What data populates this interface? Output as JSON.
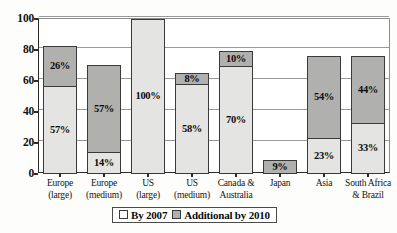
{
  "chart_data": {
    "type": "bar",
    "subtype": "stacked-bar",
    "title": "",
    "xlabel": "",
    "ylabel": "",
    "ylim": [
      0,
      100
    ],
    "yticks": [
      0,
      20,
      40,
      60,
      80,
      100
    ],
    "grid": true,
    "legend_position": "bottom-center",
    "categories": [
      "Europe (large)",
      "Europe (medium)",
      "US (large)",
      "US (medium)",
      "Canada & Australia",
      "Japan",
      "Asia",
      "South Africa & Brazil"
    ],
    "category_lines": [
      [
        "Europe",
        "(large)"
      ],
      [
        "Europe",
        "(medium)"
      ],
      [
        "US",
        "(large)"
      ],
      [
        "US",
        "(medium)"
      ],
      [
        "Canada &",
        "Australia"
      ],
      [
        "Japan",
        ""
      ],
      [
        "Asia",
        ""
      ],
      [
        "South Africa",
        "& Brazil"
      ]
    ],
    "series": [
      {
        "name": "By 2007",
        "color": "#e4e4e2",
        "values": [
          57,
          14,
          100,
          58,
          70,
          0,
          23,
          33
        ]
      },
      {
        "name": "Additional by 2010",
        "color": "#b0b0ae",
        "values": [
          26,
          57,
          0,
          8,
          10,
          9,
          54,
          44
        ]
      }
    ],
    "totals": [
      83,
      71,
      100,
      66,
      80,
      9,
      77,
      77
    ],
    "data_labels": {
      "by2007": [
        "57%",
        "14%",
        "100%",
        "58%",
        "70%",
        "",
        "23%",
        "33%"
      ],
      "additional": [
        "26%",
        "57%",
        "",
        "8%",
        "10%",
        "9%",
        "54%",
        "44%"
      ]
    }
  },
  "legend": {
    "items": [
      {
        "label": "By 2007",
        "swatch": "by2007"
      },
      {
        "label": "Additional by 2010",
        "swatch": "additional"
      }
    ]
  }
}
